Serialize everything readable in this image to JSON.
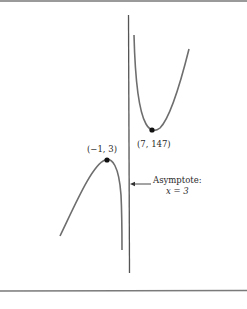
{
  "diagram": {
    "type": "function-graph",
    "asymptote": {
      "label_line1": "Asymptote:",
      "label_line2": "x = 3",
      "x_value": 3
    },
    "points": [
      {
        "name": "local-maximum",
        "label": "(−1, 3)",
        "x": -1,
        "y": 3
      },
      {
        "name": "local-minimum",
        "label": "(7, 147)",
        "x": 7,
        "y": 147
      }
    ],
    "colors": {
      "curve": "#6e6e6e",
      "asymptote": "#555555",
      "point": "#111111",
      "text": "#2a2a2a",
      "rule": "#7a7a7a"
    }
  }
}
